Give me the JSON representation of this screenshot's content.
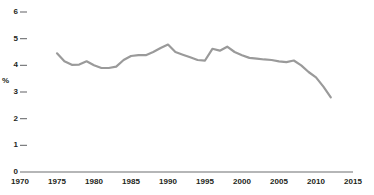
{
  "chart_data": {
    "type": "line",
    "title": "",
    "subtitle": "",
    "xlabel": "",
    "ylabel": "%",
    "xlim": [
      1970,
      2015
    ],
    "ylim": [
      0,
      6
    ],
    "grid": false,
    "legend": null,
    "x_ticks": [
      "1970",
      "1975",
      "1980",
      "1985",
      "1990",
      "1995",
      "2000",
      "2005",
      "2010",
      "2015"
    ],
    "y_ticks": [
      "0",
      "1",
      "2",
      "3",
      "4",
      "5",
      "6"
    ],
    "line_color": "#9a9a9a",
    "axis_color": "#6d6e71",
    "series": [
      {
        "name": "series-1",
        "x": [
          1975,
          1976,
          1977,
          1978,
          1979,
          1980,
          1981,
          1982,
          1983,
          1984,
          1985,
          1986,
          1987,
          1988,
          1989,
          1990,
          1991,
          1992,
          1993,
          1994,
          1995,
          1996,
          1997,
          1998,
          1999,
          2000,
          2001,
          2002,
          2003,
          2004,
          2005,
          2006,
          2007,
          2008,
          2009,
          2010,
          2011,
          2012
        ],
        "values": [
          4.45,
          4.15,
          4.02,
          4.03,
          4.15,
          4.0,
          3.9,
          3.9,
          3.95,
          4.2,
          4.35,
          4.38,
          4.38,
          4.5,
          4.65,
          4.78,
          4.5,
          4.4,
          4.3,
          4.2,
          4.18,
          4.62,
          4.55,
          4.7,
          4.5,
          4.38,
          4.28,
          4.25,
          4.22,
          4.2,
          4.15,
          4.12,
          4.18,
          4.0,
          3.75,
          3.55,
          3.2,
          2.8
        ]
      }
    ]
  },
  "y_axis": {
    "ticks": [
      {
        "label": "6",
        "value": 6
      },
      {
        "label": "5",
        "value": 5
      },
      {
        "label": "4",
        "value": 4
      },
      {
        "label": "3",
        "value": 3
      },
      {
        "label": "2",
        "value": 2
      },
      {
        "label": "1",
        "value": 1
      },
      {
        "label": "0",
        "value": 0
      }
    ],
    "unit_label": "%"
  },
  "x_axis": {
    "ticks": [
      {
        "label": "1970",
        "value": 1970
      },
      {
        "label": "1975",
        "value": 1975
      },
      {
        "label": "1980",
        "value": 1980
      },
      {
        "label": "1985",
        "value": 1985
      },
      {
        "label": "1990",
        "value": 1990
      },
      {
        "label": "1995",
        "value": 1995
      },
      {
        "label": "2000",
        "value": 2000
      },
      {
        "label": "2005",
        "value": 2005
      },
      {
        "label": "2010",
        "value": 2010
      },
      {
        "label": "2015",
        "value": 2015
      }
    ]
  }
}
